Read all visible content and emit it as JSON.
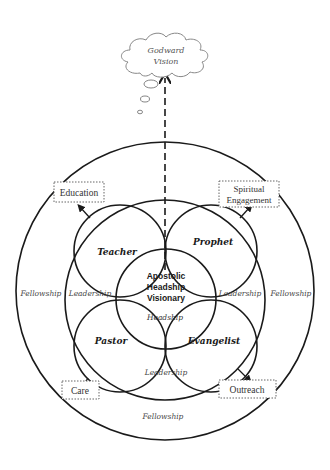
{
  "diagram": {
    "cloud": {
      "line1": "Godward",
      "line2": "Vision"
    },
    "center": {
      "line1": "Apostolic",
      "line2": "Headship",
      "line3": "Visionary"
    },
    "roles": {
      "teacher": "Teacher",
      "prophet": "Prophet",
      "pastor": "Pastor",
      "evangelist": "Evangelist"
    },
    "ring_labels": {
      "headship": "Headship",
      "leadership_left": "Leadership",
      "leadership_right": "Leadership",
      "leadership_bottom": "Leadership",
      "fellowship_left": "Fellowship",
      "fellowship_right": "Fellowship",
      "fellowship_bottom": "Fellowship"
    },
    "outputs": {
      "education": "Education",
      "spiritual_line1": "Spiritual",
      "spiritual_line2": "Engagement",
      "care": "Care",
      "outreach": "Outreach"
    },
    "colors": {
      "line": "#1a1a1a",
      "text_gray": "#444444",
      "box_border": "#555555"
    }
  }
}
